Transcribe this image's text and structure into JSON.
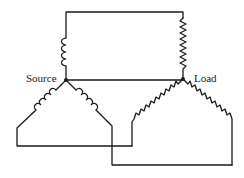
{
  "diagram": {
    "type": "three-phase wye-wye circuit",
    "labels": {
      "source": "Source",
      "load": "Load"
    },
    "nodes": {
      "source": {
        "x": 66,
        "y": 80
      },
      "load": {
        "x": 183,
        "y": 79
      }
    },
    "components": {
      "source_windings": [
        "inductor-top",
        "inductor-left",
        "inductor-right"
      ],
      "load_impedances": [
        "resistor-top",
        "resistor-left",
        "resistor-right"
      ]
    },
    "colors": {
      "line": "#1a1a1a",
      "background": "#ffffff"
    }
  }
}
